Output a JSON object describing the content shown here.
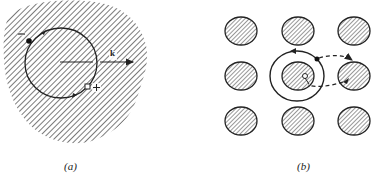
{
  "figure": {
    "panels": [
      {
        "id": "a",
        "caption": "(a)",
        "description": "Hatched continuous medium with circular electron orbit and ion",
        "charge_negative": "−",
        "charge_positive": "+",
        "vector_label": "k"
      },
      {
        "id": "b",
        "caption": "(b)",
        "description": "3x3 lattice of hatched atoms; electron orbit around central ion with dashed hopping path to neighbor"
      }
    ],
    "colors": {
      "ink": "#222222",
      "background": "#ffffff"
    }
  }
}
